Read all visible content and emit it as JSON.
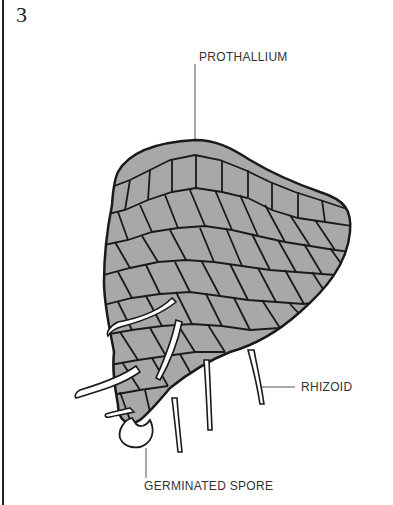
{
  "figure": {
    "number": "3"
  },
  "labels": {
    "prothallium": "PROTHALLIUM",
    "rhizoid": "RHIZOID",
    "germinated_spore": "GERMINATED SPORE"
  },
  "colors": {
    "cell_fill": "#a8a8a8",
    "cell_wall": "#1a1a1a",
    "rhizoid_fill": "#ffffff",
    "leader_line": "#555555",
    "text": "#333333"
  }
}
